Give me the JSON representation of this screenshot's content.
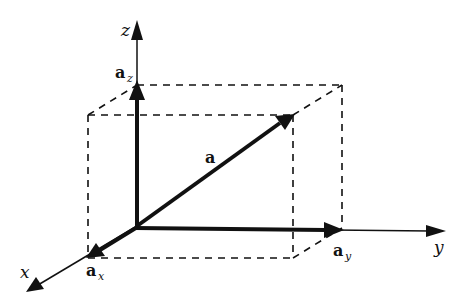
{
  "diagram": {
    "axes": [
      {
        "name": "x",
        "label": "x"
      },
      {
        "name": "y",
        "label": "y"
      },
      {
        "name": "z",
        "label": "z"
      }
    ],
    "vectors": [
      {
        "name": "a",
        "label": "a",
        "subscript": ""
      },
      {
        "name": "a_x",
        "label": "a",
        "subscript": "x"
      },
      {
        "name": "a_y",
        "label": "a",
        "subscript": "y"
      },
      {
        "name": "a_z",
        "label": "a",
        "subscript": "z"
      }
    ],
    "colors": {
      "ink": "#111111",
      "background": "#ffffff"
    }
  }
}
